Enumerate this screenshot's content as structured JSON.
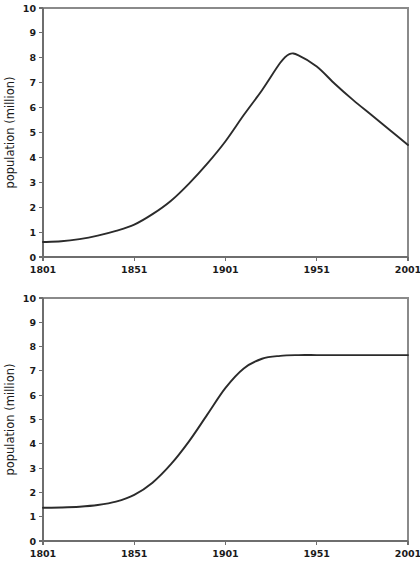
{
  "chart_data": [
    {
      "id": "top",
      "type": "line",
      "title": "",
      "xlabel": "",
      "ylabel": "population (million)",
      "xlim": [
        1801,
        2001
      ],
      "ylim": [
        0,
        10
      ],
      "xticks": [
        1801,
        1851,
        1901,
        1951,
        2001
      ],
      "yticks": [
        0,
        1,
        2,
        3,
        4,
        5,
        6,
        7,
        8,
        9,
        10
      ],
      "grid": false,
      "legend": "none",
      "series": [
        {
          "name": "population",
          "x": [
            1801,
            1811,
            1821,
            1831,
            1841,
            1851,
            1861,
            1871,
            1881,
            1891,
            1901,
            1911,
            1921,
            1931,
            1936,
            1941,
            1951,
            1961,
            1971,
            1981,
            1991,
            2001
          ],
          "values": [
            0.6,
            0.63,
            0.72,
            0.86,
            1.05,
            1.3,
            1.72,
            2.25,
            2.95,
            3.75,
            4.65,
            5.7,
            6.7,
            7.8,
            8.15,
            8.1,
            7.65,
            6.95,
            6.3,
            5.7,
            5.1,
            4.5
          ]
        }
      ]
    },
    {
      "id": "bottom",
      "type": "line",
      "title": "",
      "xlabel": "",
      "ylabel": "population (million)",
      "xlim": [
        1801,
        2001
      ],
      "ylim": [
        0,
        10
      ],
      "xticks": [
        1801,
        1851,
        1901,
        1951,
        2001
      ],
      "yticks": [
        0,
        1,
        2,
        3,
        4,
        5,
        6,
        7,
        8,
        9,
        10
      ],
      "grid": false,
      "legend": "none",
      "series": [
        {
          "name": "population",
          "x": [
            1801,
            1811,
            1821,
            1831,
            1841,
            1851,
            1861,
            1871,
            1881,
            1891,
            1901,
            1911,
            1921,
            1931,
            1941,
            1951,
            1961,
            1971,
            1981,
            1991,
            2001
          ],
          "values": [
            1.37,
            1.38,
            1.41,
            1.48,
            1.62,
            1.9,
            2.4,
            3.15,
            4.1,
            5.2,
            6.3,
            7.1,
            7.5,
            7.62,
            7.65,
            7.65,
            7.65,
            7.65,
            7.65,
            7.65,
            7.65
          ]
        }
      ]
    }
  ]
}
